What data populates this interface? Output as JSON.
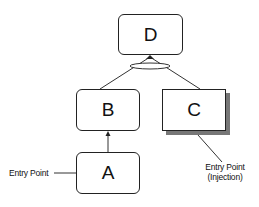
{
  "diagram": {
    "nodes": [
      {
        "id": "D",
        "label": "D",
        "style": "rounded"
      },
      {
        "id": "B",
        "label": "B",
        "style": "rounded"
      },
      {
        "id": "C",
        "label": "C",
        "style": "square-shadow"
      },
      {
        "id": "A",
        "label": "A",
        "style": "rounded"
      }
    ],
    "edges": [
      {
        "from": "A",
        "to": "B",
        "type": "arrow"
      },
      {
        "from": "B",
        "to": "D",
        "type": "arrow-joined"
      },
      {
        "from": "C",
        "to": "D",
        "type": "arrow-joined"
      }
    ],
    "annotations": {
      "entry_point": "Entry Point",
      "entry_point_injection_line1": "Entry Point",
      "entry_point_injection_line2": "(Injection)"
    }
  }
}
